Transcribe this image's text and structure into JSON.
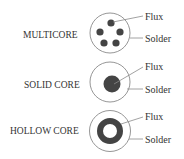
{
  "colors": {
    "stroke": "#8a8a8a",
    "flux_fill": "#444444",
    "text": "#333333",
    "background": "#ffffff"
  },
  "rows": [
    {
      "type": "multicore",
      "label": "MULTICORE",
      "callouts": {
        "flux": "Flux",
        "solder": "Solder"
      }
    },
    {
      "type": "solid",
      "label": "SOLID CORE",
      "callouts": {
        "flux": "Flux",
        "solder": "Solder"
      }
    },
    {
      "type": "hollow",
      "label": "HOLLOW CORE",
      "callouts": {
        "flux": "Flux",
        "solder": "Solder"
      }
    }
  ]
}
